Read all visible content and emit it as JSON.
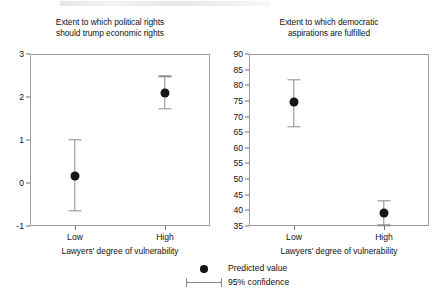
{
  "figure": {
    "legend": {
      "predicted_label": "Predicted value",
      "confidence_label": "95% confidence"
    }
  },
  "chart_data": [
    {
      "type": "scatter",
      "panel": "left",
      "title": "Extent to which political rights should trump economic rights",
      "title_line1": "Extent to which political rights",
      "title_line2": "should trump economic rights",
      "xlabel": "Lawyers' degree of vulnerability",
      "ylabel": "",
      "categories": [
        "Low",
        "High"
      ],
      "ylim": [
        -1,
        3
      ],
      "yticks": [
        -1,
        0,
        1,
        2,
        3
      ],
      "ytick_labels": [
        "-1",
        "0",
        "1",
        "2",
        "3"
      ],
      "grid": false,
      "legend_position": "bottom-center",
      "series": [
        {
          "name": "Predicted value",
          "values": [
            0.17,
            2.1
          ],
          "ci_low": [
            -0.65,
            1.72
          ],
          "ci_high": [
            1.0,
            2.48
          ]
        }
      ]
    },
    {
      "type": "scatter",
      "panel": "right",
      "title": "Extent to which democratic aspirations are fulfilled",
      "title_line1": "Extent to which democratic",
      "title_line2": "aspirations are fulfilled",
      "xlabel": "Lawyers' degree of vulnerability",
      "ylabel": "",
      "categories": [
        "Low",
        "High"
      ],
      "ylim": [
        35,
        90
      ],
      "yticks": [
        35,
        40,
        45,
        50,
        55,
        60,
        65,
        70,
        75,
        80,
        85,
        90
      ],
      "ytick_labels": [
        "35",
        "40",
        "45",
        "50",
        "55",
        "60",
        "65",
        "70",
        "75",
        "80",
        "85",
        "90"
      ],
      "grid": false,
      "legend_position": "bottom-center",
      "series": [
        {
          "name": "Predicted value",
          "values": [
            74.8,
            39.2
          ],
          "ci_low": [
            66.8,
            35.2
          ],
          "ci_high": [
            81.8,
            43.1
          ]
        }
      ]
    }
  ]
}
